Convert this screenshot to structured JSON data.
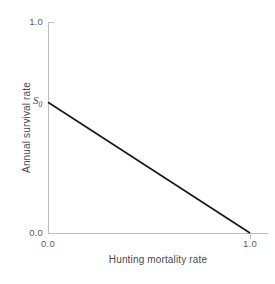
{
  "chart_data": {
    "type": "line",
    "title": "",
    "subtitle": "",
    "xlabel": "Hunting mortality rate",
    "ylabel": "Annual survival rate",
    "xlim": [
      0.0,
      1.0
    ],
    "ylim": [
      0.0,
      1.0
    ],
    "grid": false,
    "legend": null,
    "x_tick_labels": [
      "0.0",
      "1.0"
    ],
    "y_tick_labels": [
      "0.0",
      "1.0"
    ],
    "x_ticks": [
      0.0,
      1.0
    ],
    "y_ticks": [
      0.0,
      1.0
    ],
    "annotations": [
      {
        "name": "s0-intercept",
        "text": "S0",
        "text_base": "S",
        "text_sub": "0",
        "x": 0.0,
        "y": 0.62
      }
    ],
    "series": [
      {
        "name": "survival-vs-hunting-mortality",
        "color": "#1a1a1a",
        "x": [
          0.0,
          1.0
        ],
        "values": [
          0.62,
          0.0
        ]
      }
    ]
  },
  "axes": {
    "y_top_label": "1.0",
    "y_bottom_label": "0.0",
    "x_left_label": "0.0",
    "x_right_label": "1.0",
    "x_title": "Hunting mortality rate",
    "y_title": "Annual survival rate",
    "s0_base": "S",
    "s0_sub": "0"
  },
  "colors": {
    "axis": "#bfbfbf",
    "line": "#1a1a1a",
    "text": "#4a4a4a",
    "tick_text": "#5c5c5c",
    "background": "#ffffff"
  }
}
